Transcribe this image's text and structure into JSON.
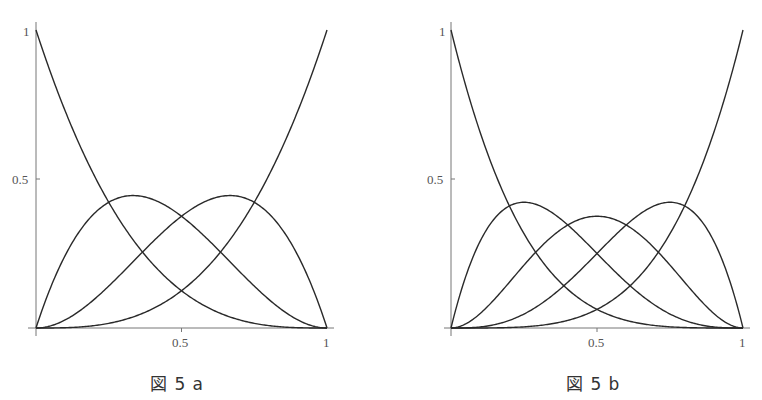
{
  "chart_data": [
    {
      "type": "line",
      "title": "図5a",
      "caption": "図 5 a",
      "description": "Bernstein basis polynomials of degree 3 on [0,1]",
      "xlabel": "",
      "ylabel": "",
      "xlim": [
        0,
        1
      ],
      "ylim": [
        0,
        1
      ],
      "x_ticks": [
        "0.5",
        "1"
      ],
      "y_ticks": [
        "0.5",
        "1"
      ],
      "grid": false,
      "legend": null,
      "degree": 3,
      "series": [
        {
          "name": "B0,3 = (1-t)^3",
          "x": [
            0,
            0.25,
            0.5,
            0.75,
            1
          ],
          "values": [
            1,
            0.422,
            0.125,
            0.016,
            0
          ]
        },
        {
          "name": "B1,3 = 3t(1-t)^2",
          "x": [
            0,
            0.25,
            0.333,
            0.5,
            0.75,
            1
          ],
          "values": [
            0,
            0.422,
            0.444,
            0.375,
            0.141,
            0
          ]
        },
        {
          "name": "B2,3 = 3t^2(1-t)",
          "x": [
            0,
            0.25,
            0.5,
            0.667,
            0.75,
            1
          ],
          "values": [
            0,
            0.141,
            0.375,
            0.444,
            0.422,
            0
          ]
        },
        {
          "name": "B3,3 = t^3",
          "x": [
            0,
            0.25,
            0.5,
            0.75,
            1
          ],
          "values": [
            0,
            0.016,
            0.125,
            0.422,
            1
          ]
        }
      ]
    },
    {
      "type": "line",
      "title": "図5b",
      "caption": "図 5 b",
      "description": "Bernstein basis polynomials of degree 4 on [0,1]",
      "xlabel": "",
      "ylabel": "",
      "xlim": [
        0,
        1
      ],
      "ylim": [
        0,
        1
      ],
      "x_ticks": [
        "0.5",
        "1"
      ],
      "y_ticks": [
        "0.5",
        "1"
      ],
      "grid": false,
      "legend": null,
      "degree": 4,
      "series": [
        {
          "name": "B0,4 = (1-t)^4",
          "x": [
            0,
            0.25,
            0.5,
            0.75,
            1
          ],
          "values": [
            1,
            0.316,
            0.0625,
            0.004,
            0
          ]
        },
        {
          "name": "B1,4 = 4t(1-t)^3",
          "x": [
            0,
            0.25,
            0.5,
            0.75,
            1
          ],
          "values": [
            0,
            0.422,
            0.25,
            0.047,
            0
          ]
        },
        {
          "name": "B2,4 = 6t^2(1-t)^2",
          "x": [
            0,
            0.25,
            0.5,
            0.75,
            1
          ],
          "values": [
            0,
            0.211,
            0.375,
            0.211,
            0
          ]
        },
        {
          "name": "B3,4 = 4t^3(1-t)",
          "x": [
            0,
            0.25,
            0.5,
            0.75,
            1
          ],
          "values": [
            0,
            0.047,
            0.25,
            0.422,
            0
          ]
        },
        {
          "name": "B4,4 = t^4",
          "x": [
            0,
            0.25,
            0.5,
            0.75,
            1
          ],
          "values": [
            0,
            0.004,
            0.0625,
            0.316,
            1
          ]
        }
      ]
    }
  ],
  "figures": {
    "left": {
      "caption": "図 5 a",
      "tick_x_half": "0.5",
      "tick_x_one": "1",
      "tick_y_half": "0.5",
      "tick_y_one": "1"
    },
    "right": {
      "caption": "図 5 b",
      "tick_x_half": "0.5",
      "tick_x_one": "1",
      "tick_y_half": "0.5",
      "tick_y_one": "1"
    }
  }
}
